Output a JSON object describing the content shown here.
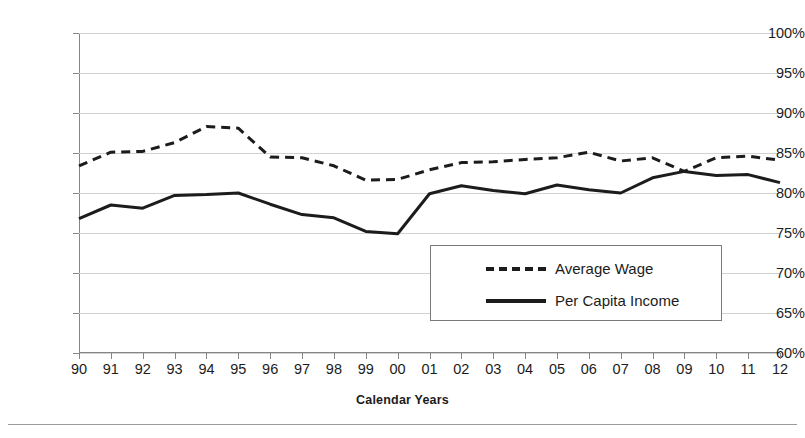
{
  "axis": {
    "x_title": "Calendar Years",
    "y_ticks": [
      "100%",
      "95%",
      "90%",
      "85%",
      "80%",
      "75%",
      "70%",
      "65%",
      "60%"
    ],
    "x_ticks": [
      "90",
      "91",
      "92",
      "93",
      "94",
      "95",
      "96",
      "97",
      "98",
      "99",
      "00",
      "01",
      "02",
      "03",
      "04",
      "05",
      "06",
      "07",
      "08",
      "09",
      "10",
      "11",
      "12"
    ]
  },
  "legend": {
    "items": [
      {
        "label": "Average Wage",
        "style": "dashed",
        "swatch": "dashed-line-swatch"
      },
      {
        "label": "Per Capita Income",
        "style": "solid",
        "swatch": "solid-line-swatch"
      }
    ]
  },
  "colors": {
    "series": "#1c1c1c",
    "grid": "#d2d2d2",
    "axis": "#868686",
    "text": "#1c1c1c",
    "background": "#ffffff"
  },
  "chart_data": {
    "type": "line",
    "title": "",
    "xlabel": "Calendar Years",
    "ylabel": "",
    "ylim": [
      60,
      100
    ],
    "ytick_step": 5,
    "yunit": "%",
    "grid": true,
    "legend_position": "center-right-inside",
    "categories": [
      "90",
      "91",
      "92",
      "93",
      "94",
      "95",
      "96",
      "97",
      "98",
      "99",
      "00",
      "01",
      "02",
      "03",
      "04",
      "05",
      "06",
      "07",
      "08",
      "09",
      "10",
      "11",
      "12"
    ],
    "series": [
      {
        "name": "Average Wage",
        "style": "dashed",
        "values": [
          83.4,
          85.1,
          85.2,
          86.3,
          88.3,
          88.1,
          84.5,
          84.4,
          83.4,
          81.6,
          81.7,
          82.9,
          83.8,
          83.9,
          84.2,
          84.4,
          85.1,
          84.0,
          84.4,
          82.7,
          84.4,
          84.6,
          84.1
        ]
      },
      {
        "name": "Per Capita Income",
        "style": "solid",
        "values": [
          76.8,
          78.5,
          78.1,
          79.7,
          79.8,
          80.0,
          78.6,
          77.3,
          76.9,
          75.2,
          74.9,
          79.9,
          80.9,
          80.3,
          79.9,
          81.0,
          80.4,
          80.0,
          81.9,
          82.7,
          82.2,
          82.3,
          81.3
        ]
      }
    ]
  }
}
